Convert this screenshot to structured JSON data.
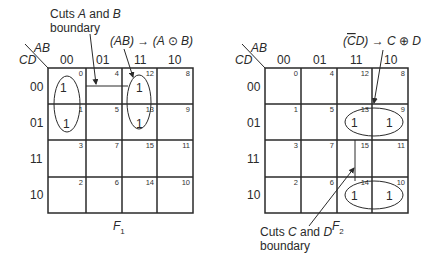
{
  "maps": [
    {
      "id": "F1",
      "title": "F",
      "title_sub": "1",
      "corner_col_var": "AB",
      "corner_row_var": "CD",
      "col_labels": [
        "00",
        "01",
        "11",
        "10"
      ],
      "row_labels": [
        "00",
        "01",
        "11",
        "10"
      ],
      "cell_indices": [
        [
          "0",
          "4",
          "12",
          "8"
        ],
        [
          "1",
          "5",
          "13",
          "9"
        ],
        [
          "3",
          "7",
          "15",
          "11"
        ],
        [
          "2",
          "6",
          "14",
          "10"
        ]
      ],
      "ones": [
        "0",
        "1",
        "12",
        "13"
      ],
      "annotations": [
        {
          "line1": "Cuts A and B",
          "line2": "boundary"
        },
        {
          "text_pre": "(AB) → (A ",
          "operator": "⊙",
          "text_post": " B)"
        }
      ]
    },
    {
      "id": "F2",
      "title": "F",
      "title_sub": "2",
      "corner_col_var": "AB",
      "corner_row_var": "CD",
      "col_labels": [
        "00",
        "01",
        "11",
        "10"
      ],
      "row_labels": [
        "00",
        "01",
        "11",
        "10"
      ],
      "cell_indices": [
        [
          "0",
          "4",
          "12",
          "8"
        ],
        [
          "1",
          "5",
          "13",
          "9"
        ],
        [
          "3",
          "7",
          "15",
          "11"
        ],
        [
          "2",
          "6",
          "14",
          "10"
        ]
      ],
      "ones": [
        "13",
        "9",
        "14",
        "10"
      ],
      "annotations": [
        {
          "text_pre": "(C̄D) → C ",
          "operator": "⊕",
          "text_post": " D"
        },
        {
          "line1": "Cuts C and D",
          "line2": "boundary"
        }
      ]
    }
  ],
  "one_value": "1"
}
